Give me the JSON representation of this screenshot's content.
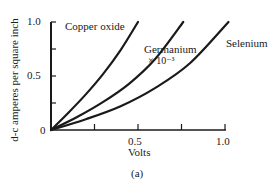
{
  "chart_data": {
    "type": "line",
    "title": "",
    "caption": "(a)",
    "xlabel": "Volts",
    "ylabel": "d-c amperes per square inch",
    "xlim": [
      0,
      1.0
    ],
    "ylim": [
      0,
      1.0
    ],
    "x_ticks": [
      0.25,
      0.5,
      0.75,
      1.0
    ],
    "x_tick_labels": [
      "",
      "0.5",
      "",
      "1.0"
    ],
    "y_ticks": [
      0.25,
      0.5,
      0.75,
      1.0
    ],
    "y_tick_labels": [
      "",
      "0.5",
      "",
      "1.0"
    ],
    "origin_label": "0",
    "grid": false,
    "legend": "inline labels",
    "series": [
      {
        "name": "Copper oxide",
        "label": "Copper oxide",
        "x": [
          0,
          0.1,
          0.2,
          0.3,
          0.4,
          0.5
        ],
        "y": [
          0,
          0.16,
          0.33,
          0.52,
          0.74,
          1.0
        ]
      },
      {
        "name": "Germanium × 10^-3",
        "label": "Germanium",
        "label2": "× 10⁻³",
        "x": [
          0,
          0.15,
          0.3,
          0.45,
          0.6,
          0.76
        ],
        "y": [
          0,
          0.12,
          0.26,
          0.43,
          0.66,
          1.0
        ]
      },
      {
        "name": "Selenium",
        "label": "Selenium",
        "x": [
          0,
          0.2,
          0.4,
          0.6,
          0.8,
          1.02
        ],
        "y": [
          0,
          0.1,
          0.22,
          0.39,
          0.62,
          1.0
        ]
      }
    ]
  }
}
